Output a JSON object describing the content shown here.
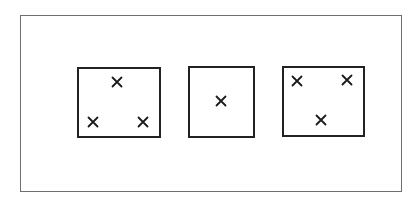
{
  "diagram": {
    "frame": {
      "x": 20,
      "y": 15,
      "w": 382,
      "h": 177
    },
    "boxes": [
      {
        "id": "box-1",
        "x": 77,
        "y": 67,
        "w": 84,
        "h": 71,
        "marks": [
          [
            117,
            82
          ],
          [
            93,
            122
          ],
          [
            143,
            122
          ]
        ],
        "count": 3
      },
      {
        "id": "box-2",
        "x": 188,
        "y": 66,
        "w": 67,
        "h": 72,
        "marks": [
          [
            221,
            101
          ]
        ],
        "count": 1
      },
      {
        "id": "box-3",
        "x": 282,
        "y": 66,
        "w": 83,
        "h": 71,
        "marks": [
          [
            297,
            81
          ],
          [
            347,
            80
          ],
          [
            321,
            120
          ]
        ],
        "count": 3
      }
    ],
    "mark_symbol": "×",
    "colors": {
      "frame": "#6e6e6e",
      "box": "#222222",
      "mark": "#1a1a1a",
      "background": "#ffffff"
    }
  }
}
